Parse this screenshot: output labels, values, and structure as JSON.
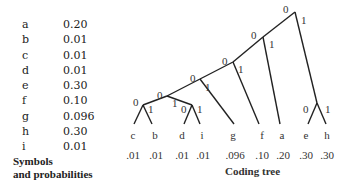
{
  "symbols_table": {
    "rows": [
      {
        "symbol": "a",
        "probability": "0.20"
      },
      {
        "symbol": "b",
        "probability": "0.01"
      },
      {
        "symbol": "c",
        "probability": "0.01"
      },
      {
        "symbol": "d",
        "probability": "0.01"
      },
      {
        "symbol": "e",
        "probability": "0.30"
      },
      {
        "symbol": "f",
        "probability": "0.10"
      },
      {
        "symbol": "g",
        "probability": "0.096"
      },
      {
        "symbol": "h",
        "probability": "0.30"
      },
      {
        "symbol": "i",
        "probability": "0.01"
      }
    ],
    "caption_line1": "Symbols",
    "caption_line2": "and probabilities"
  },
  "tree": {
    "caption": "Coding tree",
    "edge_labels": {
      "left": "0",
      "right": "1"
    },
    "leaves": [
      {
        "symbol": "c",
        "probability": ".01"
      },
      {
        "symbol": "b",
        "probability": ".01"
      },
      {
        "symbol": "d",
        "probability": ".01"
      },
      {
        "symbol": "i",
        "probability": ".01"
      },
      {
        "symbol": "g",
        "probability": ".096"
      },
      {
        "symbol": "f",
        "probability": ".10"
      },
      {
        "symbol": "a",
        "probability": ".20"
      },
      {
        "symbol": "e",
        "probability": ".30"
      },
      {
        "symbol": "h",
        "probability": ".30"
      }
    ]
  }
}
